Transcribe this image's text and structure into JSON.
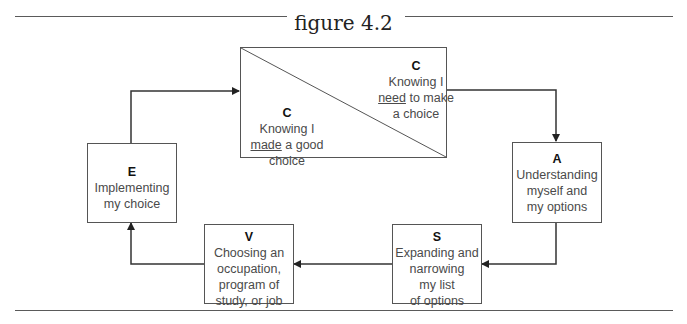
{
  "figure": {
    "title": "figure 4.2"
  },
  "nodes": {
    "c": {
      "upper": {
        "letter": "C",
        "lines": [
          "Knowing I",
          "need",
          " to make",
          "a choice"
        ]
      },
      "lower": {
        "letter": "C",
        "lines": [
          "Knowing I",
          "made",
          " a good",
          "choice"
        ]
      }
    },
    "a": {
      "letter": "A",
      "lines": [
        "Understanding",
        "myself and",
        "my options"
      ]
    },
    "s": {
      "letter": "S",
      "lines": [
        "Expanding and",
        "narrowing",
        "my list",
        "of options"
      ]
    },
    "v": {
      "letter": "V",
      "lines": [
        "Choosing an",
        "occupation,",
        "program of",
        "study, or job"
      ]
    },
    "e": {
      "letter": "E",
      "lines": [
        "Implementing",
        "my choice"
      ]
    }
  },
  "flow": [
    "C",
    "A",
    "S",
    "V",
    "E",
    "C"
  ],
  "colors": {
    "line": "#333333",
    "box_border": "#555555",
    "text": "#4a4a4a"
  }
}
